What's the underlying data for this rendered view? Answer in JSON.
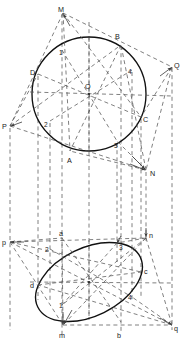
{
  "figure": {
    "colors": {
      "solid_curve": "#111111",
      "dashed_line": "#4a4a4a",
      "label_text": "#1a1a1a",
      "background": "#ffffff"
    },
    "line_styles": {
      "curve": "solid",
      "projector": "dashed",
      "construction": "dashed"
    }
  },
  "top_view": {
    "name": "circle-view",
    "center": {
      "label": "O",
      "x": 89,
      "y": 94
    },
    "radius": 57,
    "points": [
      {
        "label": "M",
        "x": 63,
        "y": 12,
        "type": "vertex",
        "lx": 61,
        "ly": 10
      },
      {
        "label": "B",
        "x": 121,
        "y": 45,
        "type": "circle-point",
        "lx": 118,
        "ly": 38
      },
      {
        "label": "Q",
        "x": 172,
        "y": 67,
        "type": "vertex",
        "lx": 174,
        "ly": 66
      },
      {
        "label": "D",
        "x": 38,
        "y": 74,
        "type": "circle-point",
        "lx": 33,
        "ly": 73
      },
      {
        "label": "4",
        "x": 132,
        "y": 70,
        "type": "division",
        "lx": 130,
        "ly": 72
      },
      {
        "label": "1",
        "x": 62,
        "y": 50,
        "type": "division",
        "lx": 62,
        "ly": 52
      },
      {
        "label": "C",
        "x": 141,
        "y": 117,
        "type": "circle-point",
        "lx": 144,
        "ly": 120
      },
      {
        "label": "P",
        "x": 10,
        "y": 126,
        "type": "vertex",
        "lx": 5,
        "ly": 127
      },
      {
        "label": "2",
        "x": 50,
        "y": 121,
        "type": "division",
        "lx": 47,
        "ly": 124
      },
      {
        "label": "3",
        "x": 117,
        "y": 141,
        "type": "division",
        "lx": 116,
        "ly": 145
      },
      {
        "label": "A",
        "x": 70,
        "y": 151,
        "type": "circle-point",
        "lx": 70,
        "ly": 160
      },
      {
        "label": "N",
        "x": 146,
        "y": 170,
        "type": "vertex",
        "lx": 150,
        "ly": 173
      }
    ],
    "labels": [
      "M",
      "B",
      "Q",
      "D",
      "O",
      "4",
      "1",
      "C",
      "P",
      "2",
      "3",
      "A",
      "N"
    ]
  },
  "front_view": {
    "name": "ellipse-view",
    "center": {
      "label": "o",
      "x": 89,
      "y": 282
    },
    "rx": 57,
    "ry": 34,
    "rotation_deg": -26,
    "points": [
      {
        "label": "p",
        "x": 10,
        "y": 242,
        "type": "vertex",
        "lx": 5,
        "ly": 243
      },
      {
        "label": "a",
        "x": 62,
        "y": 238,
        "type": "ellipse-point",
        "lx": 62,
        "ly": 234
      },
      {
        "label": "n",
        "x": 146,
        "y": 238,
        "type": "vertex",
        "lx": 149,
        "ly": 236
      },
      {
        "label": "2",
        "x": 50,
        "y": 249,
        "type": "division",
        "lx": 47,
        "ly": 250
      },
      {
        "label": "3",
        "x": 117,
        "y": 243,
        "type": "division",
        "lx": 118,
        "ly": 247
      },
      {
        "label": "c",
        "x": 141,
        "y": 272,
        "type": "ellipse-point",
        "lx": 144,
        "ly": 271
      },
      {
        "label": "d",
        "x": 38,
        "y": 285,
        "type": "ellipse-point",
        "lx": 33,
        "ly": 285
      },
      {
        "label": "4",
        "x": 132,
        "y": 297,
        "type": "division",
        "lx": 130,
        "ly": 297
      },
      {
        "label": "1",
        "x": 62,
        "y": 305,
        "type": "division",
        "lx": 62,
        "ly": 304
      },
      {
        "label": "m",
        "x": 63,
        "y": 325,
        "type": "vertex",
        "lx": 61,
        "ly": 332
      },
      {
        "label": "b",
        "x": 121,
        "y": 322,
        "type": "ellipse-point",
        "lx": 118,
        "ly": 332
      },
      {
        "label": "q",
        "x": 172,
        "y": 325,
        "type": "vertex",
        "lx": 174,
        "ly": 328
      }
    ],
    "labels": [
      "p",
      "a",
      "n",
      "2",
      "3",
      "c",
      "d",
      "4",
      "1",
      "m",
      "b",
      "q"
    ]
  },
  "projectors": {
    "vertical_x": [
      10,
      38,
      50,
      62,
      89,
      117,
      121,
      132,
      141,
      146,
      172
    ],
    "description": "vertical dashed projector lines linking top view to front view"
  }
}
